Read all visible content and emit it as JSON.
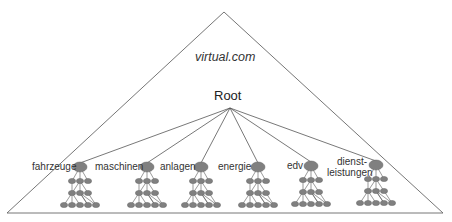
{
  "diagram": {
    "domain_label": "virtual.com",
    "root_label": "Root",
    "colors": {
      "node": "#808080",
      "node_stroke": "#666666",
      "line": "#555555",
      "text": "#333333"
    },
    "categories": [
      {
        "label": "fahrzeuge",
        "x": 80,
        "y": 167
      },
      {
        "label": "maschinen",
        "x": 147,
        "y": 167
      },
      {
        "label": "anlagen",
        "x": 201,
        "y": 167
      },
      {
        "label": "energie",
        "x": 258,
        "y": 167
      },
      {
        "label": "edv",
        "x": 311,
        "y": 166
      },
      {
        "label_line1": "dienst-",
        "label_line2": "leistungen",
        "x": 376,
        "y": 165
      }
    ]
  }
}
